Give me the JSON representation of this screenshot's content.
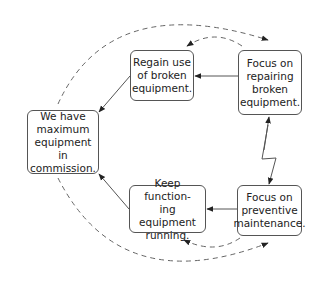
{
  "diagram": {
    "type": "cycle-flow",
    "nodes": {
      "goal": {
        "label": "We have maximum equipment in commission.",
        "lines": [
          "We have",
          "maximum",
          "equipment in",
          "commission."
        ]
      },
      "regain": {
        "label": "Regain use of broken equipment.",
        "lines": [
          "Regain use",
          "of broken",
          "equipment."
        ]
      },
      "repair": {
        "label": "Focus on repairing broken equipment.",
        "lines": [
          "Focus on",
          "repairing",
          "broken",
          "equipment."
        ]
      },
      "keep": {
        "label": "Keep functioning equipment running.",
        "lines": [
          "Keep function-",
          "ing equipment",
          "running."
        ]
      },
      "preventive": {
        "label": "Focus on preventive maintenance.",
        "lines": [
          "Focus on",
          "preventive",
          "maintenance."
        ]
      }
    },
    "edges": [
      {
        "from": "repair",
        "to": "regain",
        "style": "solid"
      },
      {
        "from": "regain",
        "to": "goal",
        "style": "solid"
      },
      {
        "from": "preventive",
        "to": "keep",
        "style": "solid"
      },
      {
        "from": "keep",
        "to": "goal",
        "style": "solid"
      },
      {
        "from": "repair",
        "to": "preventive",
        "style": "lightning-bidirectional"
      },
      {
        "from": "regain",
        "to": "repair",
        "style": "dashed-arc"
      },
      {
        "from": "repair",
        "to": "regain",
        "style": "dashed-arc"
      },
      {
        "from": "keep",
        "to": "preventive",
        "style": "dashed-arc"
      },
      {
        "from": "preventive",
        "to": "keep",
        "style": "dashed-arc"
      },
      {
        "from": "goal",
        "to": "repair",
        "style": "dashed-large-arc"
      },
      {
        "from": "goal",
        "to": "preventive",
        "style": "dashed-large-arc"
      }
    ],
    "colors": {
      "line": "#555555",
      "text": "#222222",
      "background": "#ffffff"
    }
  }
}
